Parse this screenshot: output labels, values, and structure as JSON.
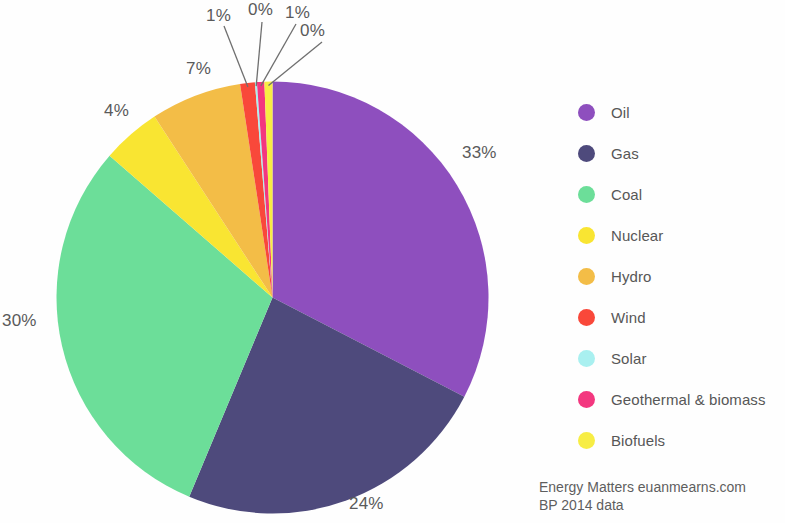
{
  "chart_data": {
    "type": "pie",
    "title": "",
    "subtitle": "",
    "categories": [
      "Oil",
      "Gas",
      "Coal",
      "Nuclear",
      "Hydro",
      "Wind",
      "Solar",
      "Geothermal & biomass",
      "Biofuels"
    ],
    "values": [
      33,
      24,
      30,
      4,
      7,
      1,
      0,
      1,
      0
    ],
    "value_labels": [
      "33%",
      "24%",
      "30%",
      "4%",
      "7%",
      "1%",
      "0%",
      "1%",
      "0%"
    ],
    "colors": [
      "#8E4FBE",
      "#4E4A7C",
      "#6CDE99",
      "#F9E532",
      "#F3BD47",
      "#F9483A",
      "#A9F0F0",
      "#F3377F",
      "#F7ED44"
    ],
    "legend_position": "right",
    "grid": false,
    "units": "percent of world primary energy",
    "start_angle_deg": 0,
    "direction": "clockwise"
  },
  "legend": {
    "items": [
      {
        "label": "Oil",
        "color": "#8E4FBE"
      },
      {
        "label": "Gas",
        "color": "#4E4A7C"
      },
      {
        "label": "Coal",
        "color": "#6CDE99"
      },
      {
        "label": "Nuclear",
        "color": "#F9E532"
      },
      {
        "label": "Hydro",
        "color": "#F3BD47"
      },
      {
        "label": "Wind",
        "color": "#F9483A"
      },
      {
        "label": "Solar",
        "color": "#A9F0F0"
      },
      {
        "label": "Geothermal & biomass",
        "color": "#F3377F"
      },
      {
        "label": "Biofuels",
        "color": "#F7ED44"
      }
    ]
  },
  "slice_labels": [
    {
      "text": "33%",
      "x": 462,
      "y": 143,
      "name": "oil"
    },
    {
      "text": "24%",
      "x": 349,
      "y": 494,
      "name": "gas"
    },
    {
      "text": "30%",
      "x": 2,
      "y": 311,
      "name": "coal"
    },
    {
      "text": "4%",
      "x": 104,
      "y": 101,
      "name": "nuclear"
    },
    {
      "text": "7%",
      "x": 186,
      "y": 59,
      "name": "hydro"
    },
    {
      "text": "1%",
      "x": 206,
      "y": 6,
      "name": "wind"
    },
    {
      "text": "0%",
      "x": 248,
      "y": 0,
      "name": "solar"
    },
    {
      "text": "1%",
      "x": 285,
      "y": 3,
      "name": "geothermal"
    },
    {
      "text": "0%",
      "x": 300,
      "y": 21,
      "name": "biofuels"
    }
  ],
  "attribution": {
    "line1": "Energy Matters euanmearns.com",
    "line2": "BP 2014 data"
  }
}
